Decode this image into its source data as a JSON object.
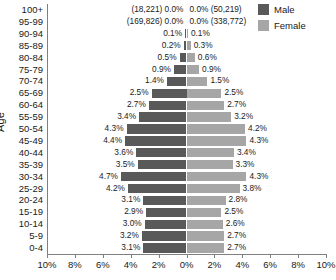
{
  "legend": {
    "items": [
      {
        "label": "Male",
        "color": "#595959",
        "swatch_name": "legend-swatch-male"
      },
      {
        "label": "Female",
        "color": "#a6a6a6",
        "swatch_name": "legend-swatch-female"
      }
    ]
  },
  "axes": {
    "ylabel": "Age",
    "xlabel": "",
    "xticklabels": [
      "10%",
      "8%",
      "6%",
      "4%",
      "2%",
      "0%",
      "2%",
      "4%",
      "6%",
      "8%",
      "10%"
    ]
  },
  "chart_data": {
    "type": "bar",
    "subtype": "population-pyramid",
    "title": "",
    "xlabel": "",
    "ylabel": "Age",
    "xlim": [
      -10,
      10
    ],
    "xtick_values": [
      -10,
      -8,
      -6,
      -4,
      -2,
      0,
      2,
      4,
      6,
      8,
      10
    ],
    "xticklabels": [
      "10%",
      "8%",
      "6%",
      "4%",
      "2%",
      "0%",
      "2%",
      "4%",
      "6%",
      "8%",
      "10%"
    ],
    "grid": false,
    "legend_position": "top-right",
    "categories": [
      "100+",
      "95-99",
      "90-94",
      "85-89",
      "80-84",
      "75-79",
      "70-74",
      "65-69",
      "60-64",
      "55-59",
      "50-54",
      "45-49",
      "40-44",
      "35-39",
      "30-34",
      "25-29",
      "20-24",
      "15-19",
      "10-14",
      "5-9",
      "0-4"
    ],
    "series": [
      {
        "name": "Male",
        "color": "#595959",
        "side": "left",
        "values": [
          0.0,
          0.0,
          0.1,
          0.2,
          0.5,
          0.9,
          1.4,
          2.5,
          2.7,
          3.4,
          4.3,
          4.4,
          3.6,
          3.5,
          4.7,
          4.2,
          3.1,
          2.9,
          3.0,
          3.2,
          3.1
        ],
        "labels": [
          "0.0%",
          "0.0%",
          "0.1%",
          "0.2%",
          "0.5%",
          "0.9%",
          "1.4%",
          "2.5%",
          "2.7%",
          "3.4%",
          "4.3%",
          "4.4%",
          "3.6%",
          "3.5%",
          "4.7%",
          "4.2%",
          "3.1%",
          "2.9%",
          "3.0%",
          "3.2%",
          "3.1%"
        ],
        "count_annotations": [
          "(18,221)",
          "(169,826)",
          "",
          "",
          "",
          "",
          "",
          "",
          "",
          "",
          "",
          "",
          "",
          "",
          "",
          "",
          "",
          "",
          "",
          "",
          ""
        ]
      },
      {
        "name": "Female",
        "color": "#a6a6a6",
        "side": "right",
        "values": [
          0.0,
          0.0,
          0.1,
          0.3,
          0.6,
          0.9,
          1.5,
          2.5,
          2.7,
          3.2,
          4.2,
          4.3,
          3.4,
          3.3,
          4.3,
          3.8,
          2.8,
          2.5,
          2.6,
          2.7,
          2.7
        ],
        "labels": [
          "0.0%",
          "0.0%",
          "0.1%",
          "0.3%",
          "0.6%",
          "0.9%",
          "1.5%",
          "2.5%",
          "2.7%",
          "3.2%",
          "4.2%",
          "4.3%",
          "3.4%",
          "3.3%",
          "4.3%",
          "3.8%",
          "2.8%",
          "2.5%",
          "2.6%",
          "2.7%",
          "2.7%"
        ],
        "count_annotations": [
          "(50,219)",
          "(338,772)",
          "",
          "",
          "",
          "",
          "",
          "",
          "",
          "",
          "",
          "",
          "",
          "",
          "",
          "",
          "",
          "",
          "",
          "",
          ""
        ]
      }
    ]
  }
}
